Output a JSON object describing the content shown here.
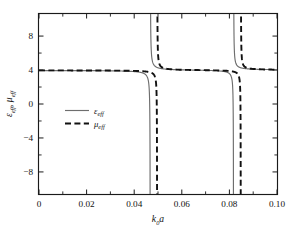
{
  "chart_data": {
    "type": "line",
    "title": "",
    "xlabel": "k₀a",
    "ylabel": "ε_eff, μ_eff",
    "xlim": [
      0,
      0.1
    ],
    "ylim": [
      -10.6,
      10.6
    ],
    "xticks": [
      0,
      0.02,
      0.04,
      0.06,
      0.08,
      0.1
    ],
    "xticklabels": [
      "0",
      "0.02",
      "0.04",
      "0.06",
      "0.08",
      "0.10"
    ],
    "xminorticks": [
      0.01,
      0.03,
      0.05,
      0.07,
      0.09
    ],
    "yticks": [
      8,
      4,
      0,
      -4,
      -8
    ],
    "yticklabels": [
      "8",
      "4",
      "0",
      "−4",
      "−8"
    ],
    "yminorticks": [
      6,
      2,
      -2,
      -6
    ],
    "grid": false,
    "legend_position": "center-left",
    "series": [
      {
        "name": "ε_eff",
        "style": "solid",
        "color": "#6e6e6e",
        "baseline": 4.0,
        "resonances": [
          {
            "pole": 0.04675,
            "strength": 9.2e-05
          },
          {
            "pole": 0.08175,
            "strength": 0.000125
          }
        ]
      },
      {
        "name": "μ_eff",
        "style": "dashed",
        "color": "#111111",
        "baseline": 4.0,
        "resonances": [
          {
            "pole": 0.04965,
            "strength": 7e-05
          },
          {
            "pole": 0.0848,
            "strength": 0.000105
          }
        ]
      }
    ],
    "notes": [
      "Lorentz-type resonant dispersion of effective permittivity and permeability.",
      "Both curves approach 4 away from resonance.",
      "Each series diverges to +infinity left of its pole and to -infinity right of its pole."
    ]
  },
  "legend": {
    "entries": [
      {
        "label": "ε",
        "sub": "eff",
        "style": "solid"
      },
      {
        "label": "μ",
        "sub": "eff",
        "style": "dashed"
      }
    ]
  },
  "axes": {
    "x_main": "k",
    "x_sub": "0",
    "x_tail": "a",
    "y_first": "ε",
    "y_first_sub": "eff",
    "y_sep": ", ",
    "y_second": "μ",
    "y_second_sub": "eff"
  }
}
